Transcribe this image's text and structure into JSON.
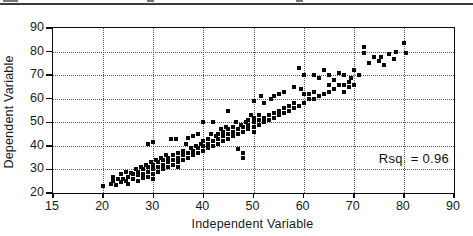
{
  "chart_data": {
    "type": "scatter",
    "title": "",
    "xlabel": "Independent Variable",
    "ylabel": "Dependent Variable",
    "annotation": "Rsq. = 0.96",
    "x_ticks": [
      15,
      20,
      30,
      40,
      50,
      60,
      70,
      80,
      90
    ],
    "y_ticks": [
      20,
      30,
      40,
      50,
      60,
      70,
      80,
      90
    ],
    "xlim": [
      15,
      90
    ],
    "ylim": [
      20,
      90
    ],
    "grid": "dotted",
    "legend": "none",
    "marker": "square",
    "marker_color": "#0a0a0a",
    "frame_color": "#0d0d0d",
    "grid_color": "#5a5a5a",
    "points": [
      [
        20,
        23
      ],
      [
        21.5,
        24
      ],
      [
        22,
        25
      ],
      [
        22,
        27
      ],
      [
        22.5,
        23.5
      ],
      [
        23,
        26
      ],
      [
        23.5,
        24.5
      ],
      [
        23.5,
        28
      ],
      [
        24,
        26
      ],
      [
        24.5,
        25
      ],
      [
        24.5,
        29
      ],
      [
        25,
        27
      ],
      [
        25,
        24
      ],
      [
        25.5,
        28.5
      ],
      [
        26,
        26
      ],
      [
        26,
        28
      ],
      [
        26.5,
        30
      ],
      [
        27,
        25
      ],
      [
        27,
        27.5
      ],
      [
        27,
        29
      ],
      [
        27.5,
        31
      ],
      [
        28,
        26.5
      ],
      [
        28,
        28
      ],
      [
        28,
        30
      ],
      [
        28.5,
        32
      ],
      [
        29,
        27
      ],
      [
        29,
        29
      ],
      [
        29,
        31
      ],
      [
        29,
        41
      ],
      [
        29.5,
        33
      ],
      [
        30,
        28
      ],
      [
        30,
        30
      ],
      [
        30,
        32
      ],
      [
        30,
        41.5
      ],
      [
        30,
        26
      ],
      [
        30.5,
        34
      ],
      [
        31,
        29
      ],
      [
        31,
        31
      ],
      [
        31,
        33
      ],
      [
        31.5,
        35
      ],
      [
        32,
        30
      ],
      [
        32,
        32
      ],
      [
        32,
        34
      ],
      [
        32.5,
        36
      ],
      [
        33,
        31
      ],
      [
        33,
        33
      ],
      [
        33,
        35
      ],
      [
        33.5,
        43
      ],
      [
        34,
        32
      ],
      [
        34,
        34
      ],
      [
        34,
        36
      ],
      [
        34.5,
        43
      ],
      [
        35,
        33
      ],
      [
        35,
        35
      ],
      [
        35,
        37
      ],
      [
        35,
        31
      ],
      [
        36,
        34
      ],
      [
        36,
        36
      ],
      [
        36,
        38
      ],
      [
        36.5,
        41
      ],
      [
        37,
        35
      ],
      [
        37,
        37
      ],
      [
        37,
        43.5
      ],
      [
        37.5,
        39
      ],
      [
        38,
        36
      ],
      [
        38,
        38
      ],
      [
        38,
        44
      ],
      [
        38.5,
        40
      ],
      [
        39,
        37
      ],
      [
        39,
        39
      ],
      [
        39,
        45
      ],
      [
        39.5,
        41
      ],
      [
        40,
        38
      ],
      [
        40,
        40
      ],
      [
        40,
        42
      ],
      [
        40,
        50
      ],
      [
        41,
        39
      ],
      [
        41,
        41
      ],
      [
        41,
        43
      ],
      [
        41.5,
        45
      ],
      [
        42,
        40
      ],
      [
        42,
        42
      ],
      [
        42,
        50
      ],
      [
        42.5,
        44
      ],
      [
        43,
        41
      ],
      [
        43,
        43
      ],
      [
        43,
        45
      ],
      [
        43.5,
        47
      ],
      [
        44,
        42
      ],
      [
        44,
        44
      ],
      [
        44,
        46
      ],
      [
        44.5,
        48
      ],
      [
        45,
        43
      ],
      [
        45,
        45
      ],
      [
        45,
        47
      ],
      [
        45,
        55
      ],
      [
        46,
        44
      ],
      [
        46,
        46
      ],
      [
        46,
        48
      ],
      [
        46.5,
        50
      ],
      [
        47,
        38.5
      ],
      [
        47,
        45
      ],
      [
        47,
        47
      ],
      [
        47.5,
        49
      ],
      [
        48,
        35
      ],
      [
        48,
        37
      ],
      [
        48,
        46
      ],
      [
        48,
        48
      ],
      [
        48.5,
        50
      ],
      [
        49,
        47
      ],
      [
        49,
        49
      ],
      [
        49,
        51
      ],
      [
        49.5,
        53
      ],
      [
        50,
        46
      ],
      [
        50,
        48
      ],
      [
        50,
        50
      ],
      [
        50,
        52
      ],
      [
        50,
        59
      ],
      [
        51,
        49
      ],
      [
        51,
        51
      ],
      [
        51,
        53
      ],
      [
        51.5,
        61
      ],
      [
        52,
        50
      ],
      [
        52,
        52
      ],
      [
        52,
        58
      ],
      [
        53,
        51
      ],
      [
        53,
        53
      ],
      [
        53.5,
        60
      ],
      [
        54,
        52
      ],
      [
        54,
        54
      ],
      [
        54,
        61
      ],
      [
        55,
        53
      ],
      [
        55,
        55
      ],
      [
        55,
        62
      ],
      [
        56,
        54
      ],
      [
        56,
        56
      ],
      [
        56,
        63
      ],
      [
        57,
        55
      ],
      [
        57,
        57
      ],
      [
        58,
        56
      ],
      [
        58,
        58
      ],
      [
        58,
        65
      ],
      [
        59,
        57
      ],
      [
        59,
        73
      ],
      [
        59.5,
        64
      ],
      [
        60,
        58
      ],
      [
        60,
        62
      ],
      [
        60,
        70
      ],
      [
        61,
        60
      ],
      [
        61,
        62
      ],
      [
        62,
        60
      ],
      [
        62,
        63
      ],
      [
        62,
        70
      ],
      [
        63,
        61
      ],
      [
        63,
        69
      ],
      [
        64,
        62
      ],
      [
        64,
        72
      ],
      [
        65,
        63
      ],
      [
        65,
        66
      ],
      [
        65,
        70
      ],
      [
        66,
        64
      ],
      [
        66,
        68
      ],
      [
        67,
        66
      ],
      [
        67,
        71
      ],
      [
        68,
        63
      ],
      [
        68,
        66
      ],
      [
        68,
        70
      ],
      [
        69,
        65
      ],
      [
        69,
        67
      ],
      [
        69.5,
        69
      ],
      [
        70,
        66
      ],
      [
        70,
        72
      ],
      [
        71,
        70
      ],
      [
        72,
        79.5
      ],
      [
        72,
        82
      ],
      [
        73,
        75
      ],
      [
        74,
        77.5
      ],
      [
        75,
        76
      ],
      [
        75.5,
        77.5
      ],
      [
        76,
        74.5
      ],
      [
        77,
        79
      ],
      [
        78,
        77
      ],
      [
        78.5,
        80
      ],
      [
        80,
        83.5
      ],
      [
        80.5,
        79.5
      ]
    ]
  }
}
